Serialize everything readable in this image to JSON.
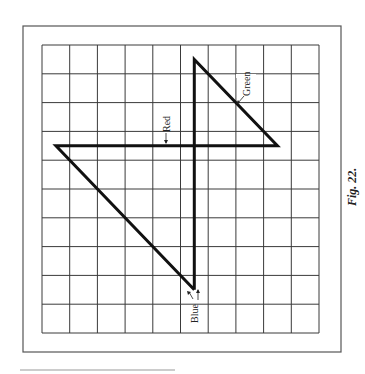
{
  "figure": {
    "caption": "Fig. 22.",
    "grid": {
      "columns": 10,
      "rows": 10
    },
    "colors": {
      "grid": "#3a3a3a",
      "path": "#111111",
      "border": "#555555",
      "paper": "#ffffff"
    },
    "labels": {
      "red": "Red",
      "green": "Green",
      "blue": "Blue"
    },
    "path_points_grid_units": [
      {
        "name": "bottom",
        "x": 5.5,
        "y": 8.5
      },
      {
        "name": "top",
        "x": 5.5,
        "y": 0.5
      },
      {
        "name": "right",
        "x": 8.5,
        "y": 3.5
      },
      {
        "name": "left",
        "x": 0.5,
        "y": 3.5
      },
      {
        "name": "bottom",
        "x": 5.5,
        "y": 8.5
      }
    ],
    "segments": [
      {
        "from": "bottom",
        "to": "top",
        "label": "Blue"
      },
      {
        "from": "top",
        "to": "right",
        "label": "Green"
      },
      {
        "from": "right",
        "to": "left",
        "label": "Red"
      },
      {
        "from": "left",
        "to": "bottom",
        "label": ""
      }
    ]
  }
}
